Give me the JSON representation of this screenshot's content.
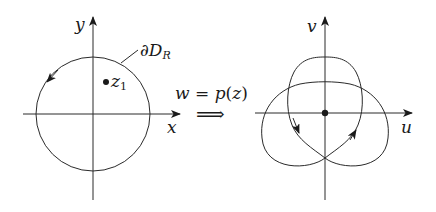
{
  "figure": {
    "left_plane": {
      "x_axis_label": "x",
      "y_axis_label": "y",
      "contour_label_prefix": "∂D",
      "contour_label_sub": "R",
      "point_label_main": "z",
      "point_label_sub": "1"
    },
    "mapping": {
      "lhs": "w",
      "eq": " = ",
      "func": "p",
      "arg_open": "(",
      "arg": "z",
      "arg_close": ")",
      "arrow": "⟹"
    },
    "right_plane": {
      "u_axis_label": "u",
      "v_axis_label": "v"
    },
    "colors": {
      "stroke": "#2a2a2a",
      "background": "#ffffff"
    }
  }
}
